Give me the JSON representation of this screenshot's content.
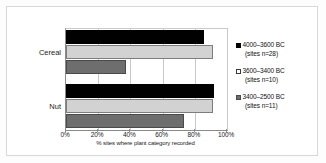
{
  "chart_data": {
    "type": "bar",
    "orientation": "horizontal",
    "title": "",
    "xlabel": "% sites where plant category recorded",
    "ylabel": "",
    "xlim": [
      0,
      100
    ],
    "xticks": [
      "0%",
      "20%",
      "40%",
      "60%",
      "80%",
      "100%"
    ],
    "xtick_values": [
      0,
      20,
      40,
      60,
      80,
      100
    ],
    "grid": true,
    "legend_position": "right",
    "categories": [
      "Cereal",
      "Nut"
    ],
    "series": [
      {
        "name": "4000–3600 BC",
        "sub": "(sites n=28)",
        "color": "#000000",
        "values": [
          86,
          92
        ]
      },
      {
        "name": "3600–3400 BC",
        "sub": "(sites n=10)",
        "color": "#d2d2d2",
        "values": [
          91,
          91
        ]
      },
      {
        "name": "3400–2500 BC",
        "sub": "(sites n=11)",
        "color": "#6e6e6e",
        "values": [
          37,
          73
        ]
      }
    ]
  }
}
